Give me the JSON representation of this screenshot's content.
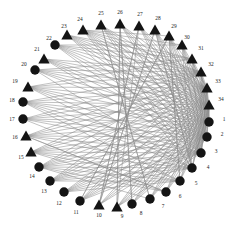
{
  "figure": {
    "type": "network-graph",
    "layout": "circular",
    "node_count": 34,
    "edge_color": "#8a8a8a",
    "node_color": "#141414",
    "background": "#ffffff"
  },
  "chart_data": {
    "type": "scatter",
    "title": "",
    "xlabel": "",
    "ylabel": "",
    "grid": false,
    "legend": "none",
    "shapes": {
      "circle": "class-1",
      "triangle": "class-2"
    },
    "nodes": [
      {
        "id": 1,
        "label": "1",
        "shape": "circle",
        "x": 209,
        "y": 122,
        "lx": 224,
        "ly": 120
      },
      {
        "id": 2,
        "label": "2",
        "shape": "circle",
        "x": 207,
        "y": 137,
        "lx": 222,
        "ly": 135
      },
      {
        "id": 3,
        "label": "3",
        "shape": "circle",
        "x": 201,
        "y": 153,
        "lx": 216,
        "ly": 152
      },
      {
        "id": 4,
        "label": "4",
        "shape": "circle",
        "x": 192,
        "y": 168,
        "lx": 208,
        "ly": 168
      },
      {
        "id": 5,
        "label": "5",
        "shape": "circle",
        "x": 180,
        "y": 181,
        "lx": 196,
        "ly": 184
      },
      {
        "id": 6,
        "label": "6",
        "shape": "circle",
        "x": 166,
        "y": 192,
        "lx": 180,
        "ly": 197
      },
      {
        "id": 7,
        "label": "7",
        "shape": "circle",
        "x": 150,
        "y": 199,
        "lx": 163,
        "ly": 207
      },
      {
        "id": 8,
        "label": "8",
        "shape": "circle",
        "x": 132,
        "y": 204,
        "lx": 141,
        "ly": 214
      },
      {
        "id": 9,
        "label": "9",
        "shape": "triangle",
        "x": 117,
        "y": 207,
        "lx": 122,
        "ly": 217
      },
      {
        "id": 10,
        "label": "10",
        "shape": "triangle",
        "x": 99,
        "y": 205,
        "lx": 99,
        "ly": 216
      },
      {
        "id": 11,
        "label": "11",
        "shape": "circle",
        "x": 80,
        "y": 201,
        "lx": 76,
        "ly": 213
      },
      {
        "id": 12,
        "label": "12",
        "shape": "circle",
        "x": 64,
        "y": 192,
        "lx": 59,
        "ly": 204
      },
      {
        "id": 13,
        "label": "13",
        "shape": "circle",
        "x": 50,
        "y": 181,
        "lx": 44,
        "ly": 192
      },
      {
        "id": 14,
        "label": "14",
        "shape": "circle",
        "x": 39,
        "y": 167,
        "lx": 32,
        "ly": 177
      },
      {
        "id": 15,
        "label": "15",
        "shape": "triangle",
        "x": 31,
        "y": 152,
        "lx": 21,
        "ly": 158
      },
      {
        "id": 16,
        "label": "16",
        "shape": "triangle",
        "x": 26,
        "y": 136,
        "lx": 15,
        "ly": 138
      },
      {
        "id": 17,
        "label": "17",
        "shape": "circle",
        "x": 23,
        "y": 119,
        "lx": 12,
        "ly": 120
      },
      {
        "id": 18,
        "label": "18",
        "shape": "circle",
        "x": 23,
        "y": 102,
        "lx": 12,
        "ly": 101
      },
      {
        "id": 19,
        "label": "19",
        "shape": "triangle",
        "x": 28,
        "y": 87,
        "lx": 15,
        "ly": 82
      },
      {
        "id": 20,
        "label": "20",
        "shape": "circle",
        "x": 35,
        "y": 70,
        "lx": 24,
        "ly": 65
      },
      {
        "id": 21,
        "label": "21",
        "shape": "triangle",
        "x": 44,
        "y": 59,
        "lx": 37,
        "ly": 50
      },
      {
        "id": 22,
        "label": "22",
        "shape": "circle",
        "x": 55,
        "y": 45,
        "lx": 49,
        "ly": 39
      },
      {
        "id": 23,
        "label": "23",
        "shape": "triangle",
        "x": 67,
        "y": 35,
        "lx": 64,
        "ly": 27
      },
      {
        "id": 24,
        "label": "24",
        "shape": "triangle",
        "x": 83,
        "y": 30,
        "lx": 80,
        "ly": 20
      },
      {
        "id": 25,
        "label": "25",
        "shape": "triangle",
        "x": 101,
        "y": 25,
        "lx": 101,
        "ly": 14
      },
      {
        "id": 26,
        "label": "26",
        "shape": "triangle",
        "x": 120,
        "y": 24,
        "lx": 120,
        "ly": 13
      },
      {
        "id": 27,
        "label": "27",
        "shape": "triangle",
        "x": 139,
        "y": 26,
        "lx": 140,
        "ly": 15
      },
      {
        "id": 28,
        "label": "28",
        "shape": "triangle",
        "x": 155,
        "y": 30,
        "lx": 158,
        "ly": 19
      },
      {
        "id": 29,
        "label": "29",
        "shape": "triangle",
        "x": 169,
        "y": 36,
        "lx": 174,
        "ly": 27
      },
      {
        "id": 30,
        "label": "30",
        "shape": "triangle",
        "x": 182,
        "y": 45,
        "lx": 187,
        "ly": 38
      },
      {
        "id": 31,
        "label": "31",
        "shape": "triangle",
        "x": 192,
        "y": 59,
        "lx": 201,
        "ly": 49
      },
      {
        "id": 32,
        "label": "32",
        "shape": "triangle",
        "x": 201,
        "y": 72,
        "lx": 211,
        "ly": 65
      },
      {
        "id": 33,
        "label": "33",
        "shape": "triangle",
        "x": 207,
        "y": 88,
        "lx": 218,
        "ly": 82
      },
      {
        "id": 34,
        "label": "34",
        "shape": "triangle",
        "x": 209,
        "y": 105,
        "lx": 221,
        "ly": 100
      }
    ],
    "edges": [
      [
        23,
        34
      ],
      [
        23,
        33
      ],
      [
        23,
        32
      ],
      [
        23,
        31
      ],
      [
        23,
        1
      ],
      [
        23,
        2
      ],
      [
        24,
        34
      ],
      [
        24,
        33
      ],
      [
        24,
        32
      ],
      [
        24,
        31
      ],
      [
        24,
        30
      ],
      [
        24,
        29
      ],
      [
        24,
        2
      ],
      [
        24,
        3
      ],
      [
        24,
        1
      ],
      [
        25,
        34
      ],
      [
        25,
        33
      ],
      [
        25,
        1
      ],
      [
        25,
        2
      ],
      [
        25,
        3
      ],
      [
        25,
        7
      ],
      [
        26,
        34
      ],
      [
        26,
        33
      ],
      [
        26,
        2
      ],
      [
        26,
        3
      ],
      [
        26,
        8
      ],
      [
        26,
        9
      ],
      [
        27,
        34
      ],
      [
        27,
        33
      ],
      [
        27,
        1
      ],
      [
        27,
        3
      ],
      [
        27,
        9
      ],
      [
        27,
        10
      ],
      [
        28,
        34
      ],
      [
        28,
        1
      ],
      [
        28,
        2
      ],
      [
        28,
        4
      ],
      [
        28,
        10
      ],
      [
        29,
        34
      ],
      [
        29,
        33
      ],
      [
        29,
        1
      ],
      [
        29,
        2
      ],
      [
        29,
        3
      ],
      [
        29,
        5
      ],
      [
        29,
        11
      ],
      [
        30,
        34
      ],
      [
        30,
        33
      ],
      [
        30,
        1
      ],
      [
        30,
        2
      ],
      [
        30,
        4
      ],
      [
        31,
        34
      ],
      [
        31,
        33
      ],
      [
        31,
        1
      ],
      [
        31,
        3
      ],
      [
        32,
        34
      ],
      [
        32,
        33
      ],
      [
        32,
        1
      ],
      [
        32,
        2
      ],
      [
        33,
        34
      ],
      [
        33,
        1
      ],
      [
        33,
        2
      ],
      [
        33,
        3
      ],
      [
        34,
        1
      ],
      [
        34,
        2
      ],
      [
        34,
        3
      ],
      [
        34,
        4
      ],
      [
        22,
        34
      ],
      [
        22,
        33
      ],
      [
        22,
        32
      ],
      [
        22,
        31
      ],
      [
        22,
        30
      ],
      [
        22,
        1
      ],
      [
        22,
        2
      ],
      [
        21,
        34
      ],
      [
        21,
        33
      ],
      [
        21,
        32
      ],
      [
        21,
        1
      ],
      [
        21,
        3
      ],
      [
        20,
        34
      ],
      [
        20,
        33
      ],
      [
        20,
        31
      ],
      [
        20,
        2
      ],
      [
        20,
        4
      ],
      [
        19,
        34
      ],
      [
        19,
        33
      ],
      [
        19,
        32
      ],
      [
        19,
        1
      ],
      [
        19,
        2
      ],
      [
        19,
        3
      ],
      [
        18,
        34
      ],
      [
        18,
        33
      ],
      [
        18,
        1
      ],
      [
        18,
        2
      ],
      [
        18,
        4
      ],
      [
        18,
        5
      ],
      [
        17,
        34
      ],
      [
        17,
        33
      ],
      [
        17,
        1
      ],
      [
        17,
        3
      ],
      [
        17,
        5
      ],
      [
        16,
        34
      ],
      [
        16,
        33
      ],
      [
        16,
        1
      ],
      [
        16,
        2
      ],
      [
        16,
        4
      ],
      [
        16,
        6
      ],
      [
        15,
        34
      ],
      [
        15,
        33
      ],
      [
        15,
        1
      ],
      [
        15,
        2
      ],
      [
        15,
        3
      ],
      [
        15,
        5
      ],
      [
        14,
        34
      ],
      [
        14,
        33
      ],
      [
        14,
        1
      ],
      [
        14,
        2
      ],
      [
        14,
        3
      ],
      [
        14,
        4
      ],
      [
        14,
        6
      ],
      [
        13,
        34
      ],
      [
        13,
        33
      ],
      [
        13,
        1
      ],
      [
        13,
        2
      ],
      [
        13,
        4
      ],
      [
        12,
        34
      ],
      [
        12,
        1
      ],
      [
        12,
        2
      ],
      [
        12,
        3
      ],
      [
        12,
        5
      ],
      [
        11,
        34
      ],
      [
        11,
        33
      ],
      [
        11,
        1
      ],
      [
        11,
        2
      ],
      [
        11,
        29
      ],
      [
        10,
        34
      ],
      [
        10,
        33
      ],
      [
        10,
        1
      ],
      [
        10,
        27
      ],
      [
        10,
        28
      ],
      [
        9,
        34
      ],
      [
        9,
        33
      ],
      [
        9,
        1
      ],
      [
        9,
        2
      ],
      [
        9,
        26
      ],
      [
        8,
        34
      ],
      [
        8,
        33
      ],
      [
        8,
        1
      ],
      [
        8,
        26
      ],
      [
        7,
        34
      ],
      [
        7,
        33
      ],
      [
        7,
        1
      ],
      [
        7,
        25
      ],
      [
        6,
        34
      ],
      [
        6,
        33
      ],
      [
        6,
        1
      ],
      [
        6,
        16
      ],
      [
        5,
        34
      ],
      [
        5,
        33
      ],
      [
        5,
        1
      ],
      [
        5,
        29
      ],
      [
        4,
        34
      ],
      [
        4,
        33
      ],
      [
        4,
        28
      ],
      [
        3,
        34
      ],
      [
        3,
        33
      ],
      [
        2,
        34
      ],
      [
        1,
        34
      ],
      [
        12,
        33
      ],
      [
        13,
        32
      ],
      [
        14,
        32
      ],
      [
        15,
        32
      ],
      [
        11,
        32
      ],
      [
        17,
        32
      ],
      [
        18,
        32
      ],
      [
        16,
        32
      ],
      [
        19,
        31
      ],
      [
        20,
        32
      ],
      [
        13,
        3
      ],
      [
        12,
        4
      ],
      [
        11,
        3
      ],
      [
        14,
        5
      ],
      [
        15,
        4
      ],
      [
        10,
        2
      ],
      [
        9,
        3
      ],
      [
        8,
        2
      ],
      [
        7,
        2
      ],
      [
        6,
        2
      ],
      [
        21,
        2
      ],
      [
        22,
        3
      ],
      [
        23,
        3
      ],
      [
        24,
        4
      ],
      [
        25,
        4
      ],
      [
        26,
        1
      ],
      [
        27,
        2
      ],
      [
        28,
        3
      ],
      [
        29,
        4
      ],
      [
        30,
        3
      ],
      [
        31,
        2
      ],
      [
        32,
        3
      ],
      [
        20,
        1
      ],
      [
        19,
        4
      ],
      [
        18,
        3
      ],
      [
        17,
        2
      ],
      [
        16,
        3
      ],
      [
        15,
        6
      ],
      [
        14,
        7
      ],
      [
        13,
        5
      ]
    ]
  }
}
